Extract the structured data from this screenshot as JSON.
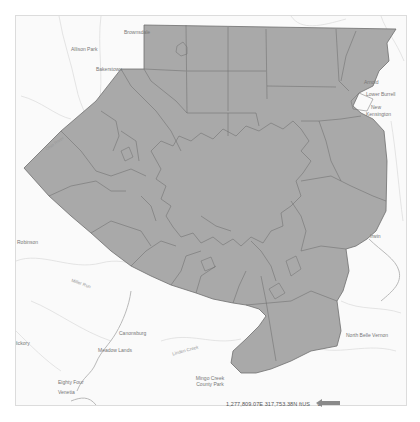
{
  "map": {
    "colors": {
      "fill": "#a9a9a9",
      "outline": "#6e6e6e",
      "basemap_bg": "#fafafa",
      "roads": "#d8d8d8",
      "rivers": "#bdbdbd"
    },
    "place_labels": [
      {
        "id": "top-center",
        "text": "Brownsdale",
        "x": 123,
        "y": 28
      },
      {
        "id": "top-left-1",
        "text": "Allison Park",
        "x": 70,
        "y": 45
      },
      {
        "id": "top-left-2",
        "text": "Bakerstown",
        "x": 95,
        "y": 65
      },
      {
        "id": "top-right-1",
        "text": "Arnold",
        "x": 375,
        "y": 78
      },
      {
        "id": "top-right-2",
        "text": "Lower Burrell",
        "x": 372,
        "y": 90
      },
      {
        "id": "top-right-3",
        "text": "New",
        "x": 378,
        "y": 103
      },
      {
        "id": "top-right-4",
        "text": "Kensington",
        "x": 373,
        "y": 110
      },
      {
        "id": "left-1",
        "text": "Robinson",
        "x": 16,
        "y": 238
      },
      {
        "id": "left-2",
        "text": "Hickory",
        "x": 12,
        "y": 339
      },
      {
        "id": "bottom-left-1",
        "text": "Canonsburg",
        "x": 118,
        "y": 329
      },
      {
        "id": "bottom-left-2",
        "text": "Meadow Lands",
        "x": 97,
        "y": 346
      },
      {
        "id": "bottom-left-3",
        "text": "Eighty Four",
        "x": 58,
        "y": 378
      },
      {
        "id": "bottom-left-4",
        "text": "Venetia",
        "x": 54,
        "y": 388
      },
      {
        "id": "bottom-mid",
        "text": "Mingo Creek County Park",
        "x": 196,
        "y": 374
      },
      {
        "id": "right-1",
        "text": "Irwin",
        "x": 371,
        "y": 232
      },
      {
        "id": "right-2",
        "text": "North Belle Vernon",
        "x": 350,
        "y": 331
      }
    ],
    "road_labels": [
      {
        "id": "road-nw",
        "text": "Ohio River",
        "x": 43,
        "y": 140
      },
      {
        "id": "road-sw",
        "text": "Miller Run",
        "x": 70,
        "y": 280
      },
      {
        "id": "road-s",
        "text": "Linden Creek",
        "x": 171,
        "y": 347
      }
    ]
  },
  "status_bar": {
    "coordinates": "1,277,809.07E 317,753.38N ftUS",
    "units_dropdown_icon": "chevron-down-icon"
  },
  "annotation": {
    "arrow_color": "#8a8a8a",
    "arrow_direction": "left"
  }
}
